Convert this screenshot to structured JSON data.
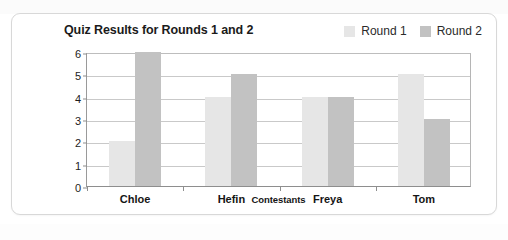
{
  "chart_data": {
    "type": "bar",
    "title": "Quiz Results for Rounds 1 and 2",
    "xlabel": "Contestants",
    "ylabel": "Number of Questions Correct",
    "categories": [
      "Chloe",
      "Hefin",
      "Freya",
      "Tom"
    ],
    "series": [
      {
        "name": "Round 1",
        "color": "#e6e6e6",
        "values": [
          2,
          4,
          4,
          5
        ]
      },
      {
        "name": "Round 2",
        "color": "#c2c2c2",
        "values": [
          6,
          5,
          4,
          3
        ]
      }
    ],
    "ylim": [
      0,
      6
    ],
    "yticks": [
      0,
      1,
      2,
      3,
      4,
      5,
      6
    ],
    "ytick_labels": [
      "0",
      "1",
      "2",
      "3",
      "4",
      "5",
      "6"
    ],
    "grid": true,
    "legend_position": "top-right"
  },
  "colors": {
    "round1": "#e6e6e6",
    "round2": "#c2c2c2",
    "gridline": "#c9c9c9",
    "axis": "#8e8e8e",
    "card_border": "#d8d8d8",
    "text": "#151515",
    "page_background": "#ffffff"
  }
}
